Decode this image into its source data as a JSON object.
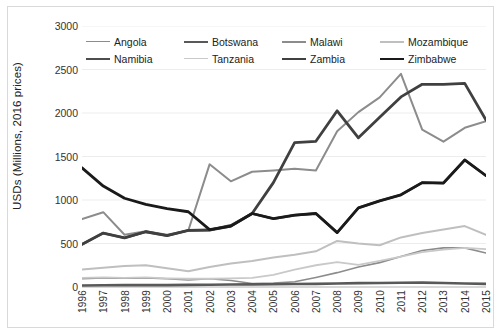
{
  "chart_data": {
    "type": "line",
    "title": "",
    "xlabel": "",
    "ylabel": "USDs (Millions, 2016 prices)",
    "ylim": [
      0,
      3000
    ],
    "yticks": [
      0,
      500,
      1000,
      1500,
      2000,
      2500,
      3000
    ],
    "grid": true,
    "legend_position": "top-inside",
    "categories": [
      "1996",
      "1997",
      "1998",
      "1999",
      "2000",
      "2001",
      "2002",
      "2003",
      "2004",
      "2005",
      "2006",
      "2007",
      "2008",
      "2009",
      "2010",
      "2011",
      "2012",
      "2013",
      "2014",
      "2015"
    ],
    "series": [
      {
        "name": "Angola",
        "color": "#8c8c8c",
        "width": 1.6,
        "values": [
          95,
          105,
          100,
          105,
          95,
          80,
          95,
          75,
          40,
          45,
          60,
          110,
          165,
          230,
          280,
          350,
          420,
          450,
          450,
          390
        ]
      },
      {
        "name": "Botswana",
        "color": "#595959",
        "width": 2.6,
        "values": [
          18,
          20,
          22,
          22,
          22,
          24,
          26,
          28,
          30,
          32,
          34,
          36,
          40,
          44,
          46,
          48,
          50,
          46,
          40,
          36
        ]
      },
      {
        "name": "Malawi",
        "color": "#8c8c8c",
        "width": 2.0,
        "values": [
          780,
          860,
          600,
          640,
          600,
          650,
          1410,
          1215,
          1325,
          1340,
          1360,
          1340,
          1790,
          2010,
          2180,
          2450,
          1810,
          1670,
          1830,
          1905
        ]
      },
      {
        "name": "Mozambique",
        "color": "#bfbfbf",
        "width": 2.0,
        "values": [
          200,
          220,
          240,
          250,
          215,
          180,
          230,
          270,
          300,
          340,
          370,
          410,
          530,
          500,
          480,
          570,
          620,
          660,
          700,
          600
        ]
      },
      {
        "name": "Namibia",
        "color": "#4d4d4d",
        "width": 2.4,
        "values": [
          490,
          620,
          565,
          635,
          590,
          650,
          655,
          710,
          845,
          785,
          825,
          845,
          625,
          910,
          990,
          1060,
          1200,
          1195,
          1460,
          1280
        ]
      },
      {
        "name": "Tanzania",
        "color": "#c9c9c9",
        "width": 1.8,
        "values": [
          105,
          110,
          105,
          110,
          100,
          95,
          95,
          100,
          105,
          140,
          200,
          250,
          285,
          255,
          300,
          350,
          400,
          430,
          450,
          435
        ]
      },
      {
        "name": "Zambia",
        "color": "#404040",
        "width": 2.8,
        "values": [
          490,
          620,
          565,
          635,
          590,
          650,
          655,
          700,
          845,
          1200,
          1660,
          1675,
          2025,
          1715,
          1950,
          2185,
          2330,
          2330,
          2340,
          1920
        ]
      },
      {
        "name": "Zimbabwe",
        "color": "#1a1a1a",
        "width": 2.8,
        "values": [
          1370,
          1160,
          1020,
          950,
          900,
          865,
          660,
          700,
          845,
          785,
          825,
          845,
          625,
          910,
          990,
          1060,
          1200,
          1195,
          1460,
          1280
        ]
      }
    ]
  },
  "legend": {
    "rows": [
      [
        "Angola",
        "Botswana",
        "Malawi",
        "Mozambique"
      ],
      [
        "Namibia",
        "Tanzania",
        "Zambia",
        "Zimbabwe"
      ]
    ]
  }
}
